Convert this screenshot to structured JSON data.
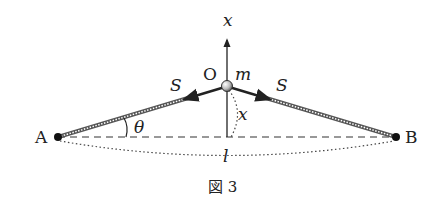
{
  "figure": {
    "caption": "図 3",
    "labels": {
      "axis": "x",
      "origin": "O",
      "mass": "m",
      "tension_left": "S",
      "tension_right": "S",
      "point_a": "A",
      "point_b": "B",
      "angle": "θ",
      "displacement": "x",
      "length": "l"
    }
  }
}
